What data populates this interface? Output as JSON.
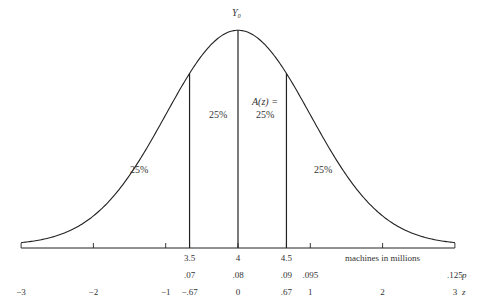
{
  "title_label": "Y₀",
  "regions": [
    {
      "label": "25%",
      "position": "left-tail"
    },
    {
      "label": "25%",
      "position": "left-center"
    },
    {
      "label": "A(z) =",
      "position": "right-center-heading"
    },
    {
      "label": "25%",
      "position": "right-center"
    },
    {
      "label": "25%",
      "position": "right-tail"
    }
  ],
  "axis": {
    "label": "machines in millions",
    "x_ticks": [
      {
        "z": -0.67,
        "label": "3.5"
      },
      {
        "z": 0,
        "label": "4"
      },
      {
        "z": 0.67,
        "label": "4.5"
      }
    ],
    "p_row_label": "p",
    "p_values": [
      {
        "z": -0.67,
        "label": ".07"
      },
      {
        "z": 0,
        "label": ".08"
      },
      {
        "z": 0.67,
        "label": ".09"
      },
      {
        "z": 1,
        "label": ".095"
      },
      {
        "z": 3,
        "label": ".125"
      }
    ],
    "z_row_label": "z",
    "z_values": [
      {
        "z": -3,
        "label": "−3"
      },
      {
        "z": -2,
        "label": "−2"
      },
      {
        "z": -1,
        "label": "−1"
      },
      {
        "z": -0.67,
        "label": "−.67"
      },
      {
        "z": 0,
        "label": "0"
      },
      {
        "z": 0.67,
        "label": ".67"
      },
      {
        "z": 1,
        "label": "1"
      },
      {
        "z": 2,
        "label": "2"
      },
      {
        "z": 3,
        "label": "3"
      }
    ]
  },
  "chart_data": {
    "type": "line",
    "title": "",
    "xlabel": "machines in millions",
    "ylabel": "",
    "xlim": [
      -3,
      3
    ],
    "quartile_cuts_z": [
      -0.67,
      0,
      0.67
    ],
    "quartile_areas": [
      "25%",
      "25%",
      "25%",
      "25%"
    ],
    "mean": 4,
    "tick_marks_z": [
      -3,
      -2,
      -1,
      -0.67,
      0,
      0.67,
      1,
      2,
      3
    ]
  }
}
